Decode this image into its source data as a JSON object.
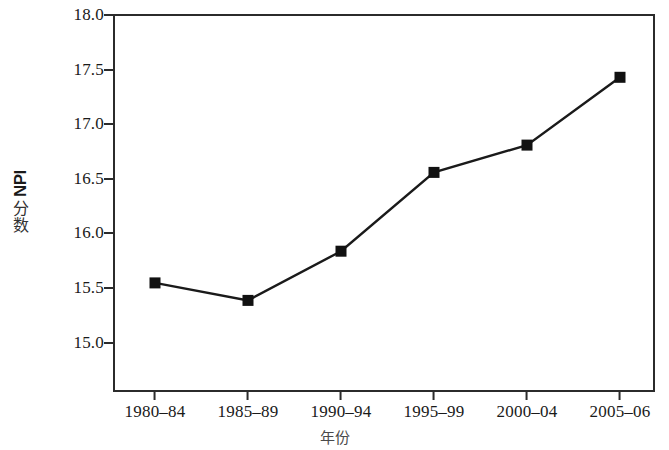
{
  "chart_data": {
    "type": "line",
    "title": "",
    "subtitle": "",
    "xlabel": "年份",
    "ylabel": "NPI 分数",
    "ylabel_latin": "NPI",
    "ylabel_cjk": "分数",
    "categories": [
      "1980–84",
      "1985–89",
      "1990–94",
      "1995–99",
      "2000–04",
      "2005–06"
    ],
    "values": [
      15.55,
      15.39,
      15.84,
      16.56,
      16.81,
      17.43
    ],
    "series": [
      {
        "name": "NPI 分数",
        "values": [
          15.55,
          15.39,
          15.84,
          16.56,
          16.81,
          17.43
        ]
      }
    ],
    "ylim": [
      14.72,
      18.0
    ],
    "yticks": [
      "18.0",
      "17.5",
      "17.0",
      "16.5",
      "16.0",
      "15.5",
      "15.0"
    ],
    "ytick_values": [
      18.0,
      17.5,
      17.0,
      16.5,
      16.0,
      15.5,
      15.0
    ],
    "grid": false,
    "legend": false,
    "legend_position": "none",
    "marker": "square",
    "marker_color": "#111111",
    "line_color": "#1a1a1a",
    "background_color": "#ffffff",
    "axis_color": "#2b2b2b"
  }
}
